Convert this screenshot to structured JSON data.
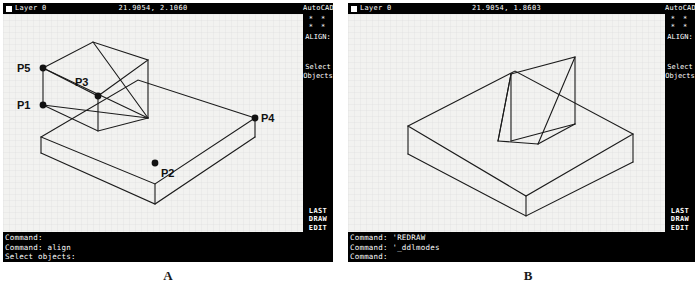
{
  "figure": {
    "caption_a": "A",
    "caption_b": "B"
  },
  "panel_a": {
    "status": {
      "layer_label": "Layer 0",
      "coords": "21.9054, 2.1060"
    },
    "side_menu": {
      "title": "AutoCAD",
      "dots": "* * * *",
      "command_name": "ALIGN:",
      "prompt_line1": "Select",
      "prompt_line2": "Objects",
      "bottom_items": [
        "LAST",
        "DRAW",
        "EDIT"
      ]
    },
    "command_lines": [
      "Command:",
      "Command: align",
      "Select objects:"
    ],
    "drawing": {
      "point_labels": [
        "P5",
        "P3",
        "P1",
        "P4",
        "P2"
      ]
    }
  },
  "panel_b": {
    "status": {
      "layer_label": "Layer 0",
      "coords": "21.9054, 1.8603"
    },
    "side_menu": {
      "title": "AutoCAD",
      "dots": "* * * *",
      "command_name": "ALIGN:",
      "prompt_line1": "Select",
      "prompt_line2": "Objects",
      "bottom_items": [
        "LAST",
        "DRAW",
        "EDIT"
      ]
    },
    "command_lines": [
      "Command: 'REDRAW",
      "Command: '_ddlmodes",
      "Command:"
    ]
  }
}
